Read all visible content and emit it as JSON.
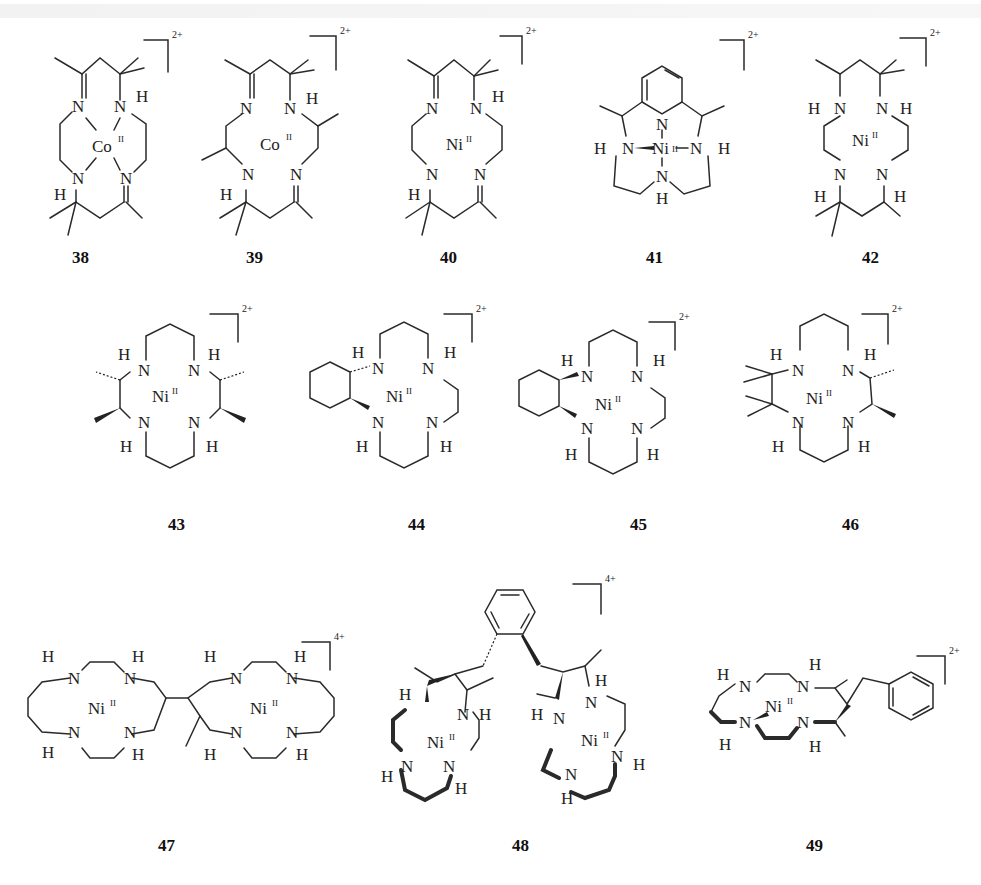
{
  "figure": {
    "compounds": [
      {
        "id": "38",
        "label": "38",
        "metal": "Co",
        "oxidation_state": "II",
        "charge": "2+"
      },
      {
        "id": "39",
        "label": "39",
        "metal": "Co",
        "oxidation_state": "II",
        "charge": "2+"
      },
      {
        "id": "40",
        "label": "40",
        "metal": "Ni",
        "oxidation_state": "II",
        "charge": "2+"
      },
      {
        "id": "41",
        "label": "41",
        "metal": "Ni",
        "oxidation_state": "II",
        "charge": "2+"
      },
      {
        "id": "42",
        "label": "42",
        "metal": "Ni",
        "oxidation_state": "II",
        "charge": "2+"
      },
      {
        "id": "43",
        "label": "43",
        "metal": "Ni",
        "oxidation_state": "II",
        "charge": "2+"
      },
      {
        "id": "44",
        "label": "44",
        "metal": "Ni",
        "oxidation_state": "II",
        "charge": "2+"
      },
      {
        "id": "45",
        "label": "45",
        "metal": "Ni",
        "oxidation_state": "II",
        "charge": "2+"
      },
      {
        "id": "46",
        "label": "46",
        "metal": "Ni",
        "oxidation_state": "II",
        "charge": "2+"
      },
      {
        "id": "47",
        "label": "47",
        "metal": "Ni",
        "oxidation_state": "II",
        "charge": "4+"
      },
      {
        "id": "48",
        "label": "48",
        "metal": "Ni",
        "oxidation_state": "II",
        "charge": "4+"
      },
      {
        "id": "49",
        "label": "49",
        "metal": "Ni",
        "oxidation_state": "II",
        "charge": "2+"
      }
    ]
  },
  "atoms": {
    "N": "N",
    "H": "H",
    "Co": "Co",
    "Ni": "Ni",
    "ox": "II"
  }
}
